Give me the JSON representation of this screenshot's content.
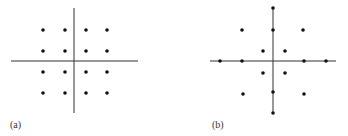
{
  "panels": [
    {
      "label": "(a)",
      "axes": {
        "cx": 74,
        "cy": 61,
        "x1": 11,
        "x2": 138,
        "y1": 8,
        "y2": 113
      },
      "points": [
        [
          43,
          30
        ],
        [
          65,
          30
        ],
        [
          86,
          30
        ],
        [
          107,
          30
        ],
        [
          43,
          51
        ],
        [
          65,
          51
        ],
        [
          86,
          51
        ],
        [
          107,
          51
        ],
        [
          43,
          72
        ],
        [
          65,
          72
        ],
        [
          86,
          72
        ],
        [
          107,
          72
        ],
        [
          43,
          93
        ],
        [
          65,
          93
        ],
        [
          86,
          93
        ],
        [
          107,
          93
        ]
      ]
    },
    {
      "label": "(b)",
      "axes": {
        "cx": 273,
        "cy": 61,
        "x1": 210,
        "x2": 336,
        "y1": 8,
        "y2": 113
      },
      "points": [
        [
          273,
          8
        ],
        [
          242,
          30
        ],
        [
          273,
          30
        ],
        [
          303,
          30
        ],
        [
          263,
          51
        ],
        [
          285,
          51
        ],
        [
          220,
          61
        ],
        [
          242,
          61
        ],
        [
          304,
          61
        ],
        [
          326,
          61
        ],
        [
          263,
          73
        ],
        [
          285,
          73
        ],
        [
          243,
          94
        ],
        [
          273,
          92
        ],
        [
          304,
          94
        ],
        [
          273,
          113
        ]
      ]
    }
  ]
}
